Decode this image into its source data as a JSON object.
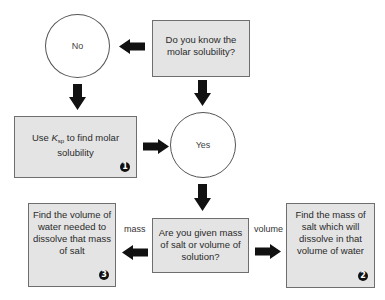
{
  "diagram": {
    "type": "flowchart",
    "nodes": {
      "question_known": {
        "shape": "box",
        "text": "Do you know the molar solubility?"
      },
      "no": {
        "shape": "circle",
        "text": "No"
      },
      "yes": {
        "shape": "circle",
        "text": "Yes"
      },
      "use_ksp": {
        "shape": "box",
        "text_before": "Use ",
        "k_symbol": "K",
        "k_subscript": "sp",
        "text_after": " to find molar solubility",
        "badge": "1"
      },
      "question_given": {
        "shape": "box",
        "text": "Are you given mass of salt or volume of solution?"
      },
      "find_volume": {
        "shape": "box",
        "text": "Find the volume of water needed to dissolve that mass of salt",
        "badge": "3"
      },
      "find_mass": {
        "shape": "box",
        "text": "Find the mass of salt which will dissolve in that volume of water",
        "badge": "2"
      }
    },
    "edges": [
      {
        "from": "question_known",
        "to": "no",
        "label": ""
      },
      {
        "from": "question_known",
        "to": "yes",
        "label": ""
      },
      {
        "from": "no",
        "to": "use_ksp",
        "label": ""
      },
      {
        "from": "use_ksp",
        "to": "yes",
        "label": ""
      },
      {
        "from": "yes",
        "to": "question_given",
        "label": ""
      },
      {
        "from": "question_given",
        "to": "find_volume",
        "label": "mass"
      },
      {
        "from": "question_given",
        "to": "find_mass",
        "label": "volume"
      }
    ],
    "edge_labels": {
      "mass": "mass",
      "volume": "volume"
    }
  }
}
